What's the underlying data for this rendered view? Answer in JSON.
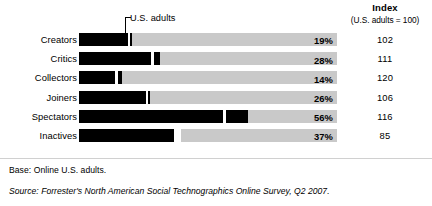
{
  "header": {
    "index_title": "Index",
    "index_subtitle": "(U.S. adults = 100)"
  },
  "annotation": {
    "label": "U.S. adults",
    "points_to_row": "Creators"
  },
  "footer": {
    "base": "Base: Online U.S. adults.",
    "source": "Source: Forrester's North American Social Technographics Online Survey, Q2 2007."
  },
  "colors": {
    "bar_fill": "#000000",
    "bar_track": "#c9c9c9",
    "text": "#000000",
    "background": "#ffffff"
  },
  "chart_data": {
    "type": "bar",
    "orientation": "horizontal",
    "title": "",
    "subtitle": "",
    "xlabel": "",
    "ylabel": "",
    "xlim": [
      0,
      100
    ],
    "grid": false,
    "legend": null,
    "value_suffix": "%",
    "categories": [
      "Creators",
      "Critics",
      "Collectors",
      "Joiners",
      "Spectators",
      "Inactives"
    ],
    "values": [
      19,
      28,
      14,
      26,
      56,
      37
    ],
    "value_labels": [
      "19%",
      "28%",
      "14%",
      "26%",
      "56%",
      "37%"
    ],
    "series": [
      {
        "name": "Percent of U.S. online adults",
        "values": [
          19,
          28,
          14,
          26,
          56,
          37
        ]
      },
      {
        "name": "Index (U.S. adults = 100)",
        "values": [
          102,
          111,
          120,
          106,
          116,
          85
        ]
      }
    ],
    "index_labels": [
      "102",
      "111",
      "120",
      "106",
      "116",
      "85"
    ],
    "annotations": [
      {
        "text": "U.S. adults",
        "target_category": "Creators",
        "description": "Benchmark tick marking the U.S. adult baseline on each bar"
      }
    ],
    "rows": [
      {
        "label": "Creators",
        "percent": 19,
        "percent_label": "19%",
        "index": 102,
        "index_label": "102",
        "tick_width": 1.6
      },
      {
        "label": "Critics",
        "percent": 28,
        "percent_label": "28%",
        "index": 111,
        "index_label": "111",
        "tick_width": 6.5
      },
      {
        "label": "Collectors",
        "percent": 14,
        "percent_label": "14%",
        "index": 120,
        "index_label": "120",
        "tick_width": 4.2
      },
      {
        "label": "Joiners",
        "percent": 26,
        "percent_label": "26%",
        "index": 106,
        "index_label": "106",
        "tick_width": 1.6
      },
      {
        "label": "Spectators",
        "percent": 56,
        "percent_label": "56%",
        "index": 116,
        "index_label": "116",
        "tick_width": 22.0
      },
      {
        "label": "Inactives",
        "percent": 37,
        "percent_label": "37%",
        "index": 85,
        "index_label": "85",
        "tick_width": 0
      }
    ]
  }
}
